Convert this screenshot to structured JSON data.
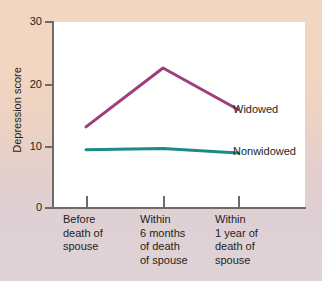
{
  "chart_data": {
    "type": "line",
    "title": "",
    "xlabel": "",
    "ylabel": "Depression score",
    "ylim": [
      0,
      30
    ],
    "yticks": [
      0,
      10,
      20,
      30
    ],
    "ytick_labels": [
      "0",
      "10",
      "20",
      "30"
    ],
    "grid": false,
    "legend_position": "right-inline",
    "categories": [
      "Before\ndeath of\nspouse",
      "Within\n6 months\nof death\nof spouse",
      "Within\n1 year of\ndeath of\nspouse"
    ],
    "series": [
      {
        "name": "Widowed",
        "color": "#9d3f79",
        "values": [
          13,
          22.5,
          15.8
        ]
      },
      {
        "name": "Nonwidowed",
        "color": "#1d8a83",
        "values": [
          9.3,
          9.5,
          8.8
        ]
      }
    ]
  },
  "axis": {
    "y_title": "Depression score",
    "y_tick_0": "0",
    "y_tick_1": "10",
    "y_tick_2": "20",
    "y_tick_3": "30"
  },
  "categories": {
    "cat0": "Before\ndeath of\nspouse",
    "cat1": "Within\n6 months\nof death\nof spouse",
    "cat2": "Within\n1 year of\ndeath of\nspouse"
  },
  "legend": {
    "widowed": "Widowed",
    "nonwidowed": "Nonwidowed"
  },
  "colors": {
    "widowed_line": "#9d3f79",
    "nonwidowed_line": "#1d8a83",
    "background_top": "#f3d6c0",
    "background_bottom": "#e0d3d8",
    "panel": "#ffffff",
    "axis": "#6e6a67",
    "text": "#231f20"
  }
}
